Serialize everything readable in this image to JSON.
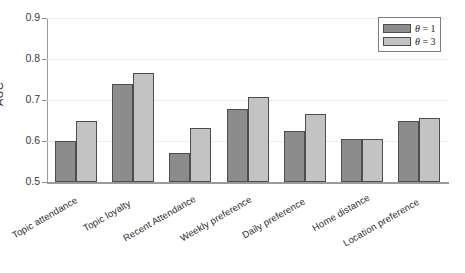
{
  "chart_data": {
    "type": "bar",
    "title": "",
    "xlabel": "",
    "ylabel": "AUC",
    "ylim": [
      0.5,
      0.9
    ],
    "yticks": [
      "0.5",
      "0.6",
      "0.7",
      "0.8",
      "0.9"
    ],
    "ytick_values": [
      0.5,
      0.6,
      0.7,
      0.8,
      0.9
    ],
    "grid": true,
    "legend_position": "top-right",
    "categories": [
      "Topic attendance",
      "Topic loyalty",
      "Recent Attendance",
      "Weekly preference",
      "Daily preference",
      "Home distance",
      "Location preference"
    ],
    "series": [
      {
        "name": "θ = 1",
        "color": "#8c8c8c",
        "values": [
          0.6,
          0.739,
          0.57,
          0.678,
          0.625,
          0.605,
          0.65
        ]
      },
      {
        "name": "θ = 3",
        "color": "#c3c3c3",
        "values": [
          0.65,
          0.766,
          0.631,
          0.708,
          0.667,
          0.605,
          0.657
        ]
      }
    ]
  },
  "legend": {
    "entries": [
      {
        "symbol": "θ",
        "equals": " = ",
        "value": "1",
        "label": "θ = 1"
      },
      {
        "symbol": "θ",
        "equals": " = ",
        "value": "3",
        "label": "θ = 3"
      }
    ]
  },
  "axes": {
    "y_title": "AUC"
  },
  "colors": {
    "series_1": "#8c8c8c",
    "series_2": "#c3c3c3",
    "bar_edge": "#4d4d4d",
    "axis": "#9a9a9a",
    "gridline": "#ededed",
    "text": "#2b2b2b",
    "background": "#ffffff"
  }
}
